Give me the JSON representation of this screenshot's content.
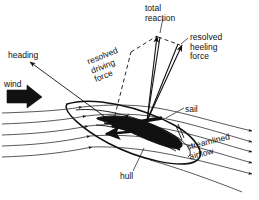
{
  "diagram": {
    "background_color": "#ffffff",
    "ink_color": "#111111",
    "labels": {
      "total_reaction": "total\nreaction",
      "resolved_heeling_force": "resolved\nheeling\nforce",
      "resolved_driving_force": "resolved\ndriving\nforce",
      "heading": "heading",
      "wind": "wind",
      "sail": "sail",
      "hull": "hull",
      "streamlined_airflow": "streamlined\nairflow"
    },
    "vectors": [
      {
        "name": "total reaction",
        "style": "solid-arrow"
      },
      {
        "name": "resolved heeling force",
        "style": "solid-arrow"
      },
      {
        "name": "resolved driving force",
        "style": "dashed-construction"
      },
      {
        "name": "heading",
        "style": "thin-arrow"
      },
      {
        "name": "wind",
        "style": "thick-block-arrow"
      },
      {
        "name": "driving force on hull",
        "style": "thick-black-arrow"
      }
    ],
    "streamlines": {
      "upwind_count": 5,
      "downwind_count": 6,
      "direction": "left to right"
    }
  }
}
